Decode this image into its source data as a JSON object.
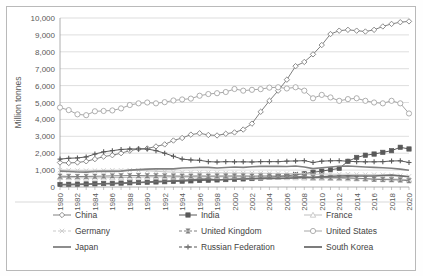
{
  "chart_data": {
    "type": "line",
    "title": "",
    "xlabel": "",
    "ylabel": "Million tonnes",
    "ylim": [
      0,
      10000
    ],
    "ytick_step": 1000,
    "ytick_labels": [
      "0",
      "1,000",
      "2,000",
      "3,000",
      "4,000",
      "5,000",
      "6,000",
      "7,000",
      "8,000",
      "9,000",
      "10,000"
    ],
    "xlim": [
      1980,
      2020
    ],
    "x": [
      1980,
      1981,
      1982,
      1983,
      1984,
      1985,
      1986,
      1987,
      1988,
      1989,
      1990,
      1991,
      1992,
      1993,
      1994,
      1995,
      1996,
      1997,
      1998,
      1999,
      2000,
      2001,
      2002,
      2003,
      2004,
      2005,
      2006,
      2007,
      2008,
      2009,
      2010,
      2011,
      2012,
      2013,
      2014,
      2015,
      2016,
      2017,
      2018,
      2019,
      2020
    ],
    "xtick_labels": [
      "1980",
      "1982",
      "1984",
      "1986",
      "1988",
      "1990",
      "1992",
      "1994",
      "1996",
      "1998",
      "2000",
      "2002",
      "2004",
      "2006",
      "2008",
      "2010",
      "2012",
      "2014",
      "2016",
      "2018",
      "2020"
    ],
    "grid": true,
    "legend_position": "bottom",
    "legend_columns": 3,
    "series": [
      {
        "name": "China",
        "marker": "diamond-open",
        "color": "#808080",
        "values": [
          1450,
          1420,
          1450,
          1520,
          1650,
          1800,
          1880,
          2000,
          2150,
          2250,
          2280,
          2400,
          2520,
          2750,
          2900,
          3100,
          3180,
          3080,
          3050,
          3150,
          3230,
          3400,
          3750,
          4450,
          5100,
          5700,
          6350,
          7150,
          7400,
          7850,
          8400,
          9050,
          9250,
          9300,
          9250,
          9200,
          9300,
          9500,
          9650,
          9750,
          9800
        ]
      },
      {
        "name": "India",
        "marker": "square-filled",
        "color": "#595959",
        "values": [
          150,
          160,
          170,
          180,
          190,
          205,
          215,
          230,
          250,
          265,
          280,
          300,
          315,
          330,
          345,
          365,
          385,
          400,
          420,
          440,
          460,
          480,
          500,
          530,
          570,
          620,
          670,
          730,
          790,
          870,
          940,
          1020,
          1100,
          1520,
          1750,
          1880,
          1950,
          2050,
          2150,
          2350,
          2250
        ]
      },
      {
        "name": "France",
        "marker": "triangle-open",
        "color": "#bfbfbf",
        "values": [
          570,
          560,
          545,
          540,
          535,
          545,
          555,
          560,
          570,
          585,
          595,
          600,
          595,
          590,
          585,
          590,
          595,
          600,
          605,
          600,
          600,
          595,
          590,
          585,
          580,
          575,
          565,
          555,
          545,
          520,
          530,
          520,
          510,
          500,
          490,
          485,
          480,
          475,
          470,
          465,
          430
        ]
      },
      {
        "name": "Germany",
        "marker": "x-light",
        "color": "#c9c9c9",
        "values": [
          1000,
          990,
          970,
          965,
          970,
          980,
          985,
          985,
          990,
          985,
          960,
          930,
          900,
          880,
          865,
          855,
          850,
          845,
          840,
          830,
          830,
          825,
          820,
          815,
          810,
          805,
          800,
          795,
          785,
          740,
          770,
          760,
          755,
          755,
          740,
          730,
          730,
          725,
          700,
          670,
          630
        ]
      },
      {
        "name": "United Kingdom",
        "marker": "bowtie",
        "color": "#808080",
        "values": [
          640,
          630,
          620,
          625,
          635,
          645,
          660,
          665,
          675,
          680,
          665,
          670,
          660,
          650,
          645,
          645,
          655,
          645,
          650,
          650,
          655,
          655,
          645,
          650,
          650,
          645,
          640,
          630,
          615,
          570,
          585,
          555,
          560,
          545,
          520,
          495,
          455,
          440,
          430,
          415,
          370
        ]
      },
      {
        "name": "United States",
        "marker": "circle-open",
        "color": "#a6a6a6",
        "values": [
          4700,
          4550,
          4300,
          4250,
          4480,
          4500,
          4530,
          4650,
          4850,
          4950,
          5000,
          4950,
          5020,
          5120,
          5180,
          5230,
          5400,
          5500,
          5550,
          5620,
          5800,
          5700,
          5750,
          5790,
          5880,
          5900,
          5830,
          5900,
          5700,
          5250,
          5450,
          5300,
          5100,
          5200,
          5250,
          5100,
          5000,
          4950,
          5100,
          4950,
          4350
        ]
      },
      {
        "name": "Japan",
        "marker": "line",
        "color": "#808080",
        "values": [
          940,
          920,
          890,
          880,
          920,
          930,
          925,
          940,
          1000,
          1030,
          1060,
          1070,
          1070,
          1070,
          1120,
          1140,
          1160,
          1160,
          1120,
          1150,
          1180,
          1160,
          1200,
          1220,
          1220,
          1220,
          1210,
          1240,
          1180,
          1090,
          1140,
          1180,
          1230,
          1240,
          1210,
          1180,
          1160,
          1140,
          1110,
          1060,
          990
        ]
      },
      {
        "name": "Russian Federation",
        "marker": "plus",
        "color": "#595959",
        "values": [
          1650,
          1700,
          1720,
          1780,
          1950,
          2080,
          2150,
          2220,
          2250,
          2250,
          2250,
          2150,
          2000,
          1820,
          1650,
          1600,
          1580,
          1500,
          1480,
          1500,
          1490,
          1490,
          1480,
          1500,
          1500,
          1500,
          1530,
          1540,
          1560,
          1450,
          1530,
          1550,
          1560,
          1520,
          1500,
          1490,
          1490,
          1500,
          1540,
          1550,
          1450
        ]
      },
      {
        "name": "South Korea",
        "marker": "line",
        "color": "#6e6e6e",
        "values": [
          130,
          140,
          150,
          165,
          180,
          190,
          200,
          220,
          245,
          265,
          290,
          320,
          340,
          360,
          385,
          420,
          450,
          470,
          410,
          440,
          460,
          475,
          490,
          500,
          510,
          505,
          520,
          540,
          560,
          570,
          600,
          640,
          650,
          660,
          650,
          650,
          650,
          680,
          700,
          660,
          610
        ]
      }
    ]
  },
  "legend": {
    "items": [
      {
        "label": "China",
        "marker": "diamond-open"
      },
      {
        "label": "India",
        "marker": "square-filled"
      },
      {
        "label": "France",
        "marker": "triangle-open"
      },
      {
        "label": "Germany",
        "marker": "x-light"
      },
      {
        "label": "United Kingdom",
        "marker": "bowtie"
      },
      {
        "label": "United States",
        "marker": "circle-open"
      },
      {
        "label": "Japan",
        "marker": "line"
      },
      {
        "label": "Russian Federation",
        "marker": "plus"
      },
      {
        "label": "South Korea",
        "marker": "line"
      }
    ]
  }
}
